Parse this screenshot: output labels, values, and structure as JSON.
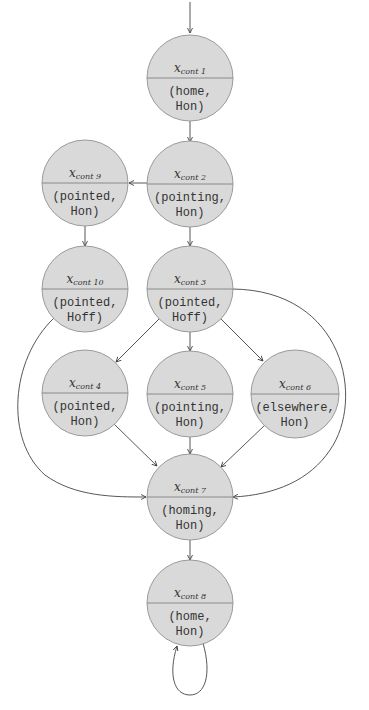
{
  "diagram": {
    "type": "state-machine",
    "node_fill": "#d9d9d9",
    "node_stroke": "#9a9a9a",
    "nodes": [
      {
        "id": "n1",
        "var": "x",
        "sub": "cont 1",
        "line1": "(home,",
        "line2": "Hon)"
      },
      {
        "id": "n2",
        "var": "x",
        "sub": "cont 2",
        "line1": "(pointing,",
        "line2": "Hon)"
      },
      {
        "id": "n9",
        "var": "x",
        "sub": "cont 9",
        "line1": "(pointed,",
        "line2": "Hon)"
      },
      {
        "id": "n10",
        "var": "x",
        "sub": "cont 10",
        "line1": "(pointed,",
        "line2": "Hoff)"
      },
      {
        "id": "n3",
        "var": "x",
        "sub": "cont 3",
        "line1": "(pointed,",
        "line2": "Hoff)"
      },
      {
        "id": "n4",
        "var": "x",
        "sub": "cont 4",
        "line1": "(pointed,",
        "line2": "Hon)"
      },
      {
        "id": "n5",
        "var": "x",
        "sub": "cont 5",
        "line1": "(pointing,",
        "line2": "Hon)"
      },
      {
        "id": "n6",
        "var": "x",
        "sub": "cont 6",
        "line1": "(elsewhere,",
        "line2": "Hon)"
      },
      {
        "id": "n7",
        "var": "x",
        "sub": "cont 7",
        "line1": "(homing,",
        "line2": "Hon)"
      },
      {
        "id": "n8",
        "var": "x",
        "sub": "cont 8",
        "line1": "(home,",
        "line2": "Hon)"
      }
    ],
    "edges": [
      [
        "start",
        "n1"
      ],
      [
        "n1",
        "n2"
      ],
      [
        "n2",
        "n9"
      ],
      [
        "n2",
        "n3"
      ],
      [
        "n9",
        "n10"
      ],
      [
        "n3",
        "n4"
      ],
      [
        "n3",
        "n5"
      ],
      [
        "n3",
        "n6"
      ],
      [
        "n3",
        "n7"
      ],
      [
        "n10",
        "n7"
      ],
      [
        "n4",
        "n7"
      ],
      [
        "n5",
        "n7"
      ],
      [
        "n6",
        "n7"
      ],
      [
        "n7",
        "n8"
      ],
      [
        "n8",
        "n8"
      ]
    ]
  }
}
